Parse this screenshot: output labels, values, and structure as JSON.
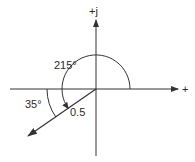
{
  "diagram": {
    "type": "complex-plane-phasor",
    "colors": {
      "stroke": "#333333",
      "text": "#2a2a2a",
      "background": "#ffffff"
    },
    "axes": {
      "origin": [
        96,
        89
      ],
      "real_axis": {
        "from": [
          10,
          89
        ],
        "to": [
          178,
          89
        ],
        "label": "+"
      },
      "imag_axis": {
        "from": [
          96,
          156
        ],
        "to": [
          96,
          20
        ],
        "label": "+j"
      }
    },
    "vector": {
      "magnitude_label": "0.5",
      "from": [
        96,
        89
      ],
      "to": [
        28,
        136
      ],
      "angle_deg": 215
    },
    "angles": [
      {
        "label": "215°",
        "description": "angle measured counter-clockwise from positive real axis"
      },
      {
        "label": "35°",
        "description": "angle below negative real axis"
      }
    ]
  }
}
